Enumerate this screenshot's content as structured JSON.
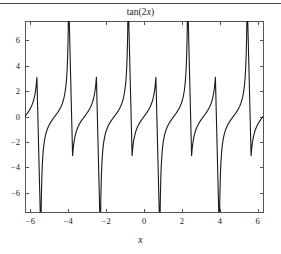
{
  "figure": {
    "title": "tan(2x)",
    "title_prefix": "tan(2",
    "title_var": "x",
    "title_suffix": ")",
    "xlabel": "x",
    "ylabel": "",
    "background_color": "#ffffff",
    "line_color": "#1a1a1a",
    "axis_color": "#555555",
    "has_top_rule": true
  },
  "chart_data": {
    "type": "line",
    "title": "tan(2x)",
    "xlabel": "x",
    "ylabel": "",
    "xlim": [
      -6.2832,
      6.2832
    ],
    "ylim": [
      -7.5,
      7.5
    ],
    "xticks": [
      -6,
      -4,
      -2,
      0,
      2,
      4,
      6
    ],
    "xticklabels": [
      "−6",
      "−4",
      "−2",
      "0",
      "2",
      "4",
      "6"
    ],
    "yticks": [
      -6,
      -4,
      -2,
      0,
      2,
      4,
      6
    ],
    "yticklabels": [
      "−6",
      "−4",
      "−2",
      "0",
      "2",
      "4",
      "6"
    ],
    "grid": false,
    "legend": null,
    "function": "tan(2*x)",
    "sampling": {
      "n_points": 61,
      "x_start": -6.2832,
      "x_end": 6.2832,
      "note": "under-sampled; consecutive samples joined across asymptotes producing steep connecting branches"
    },
    "asymptotes_x": [
      -5.4978,
      -4.7124,
      -3.927,
      -3.1416,
      -2.3562,
      -1.5708,
      -0.7854,
      0.7854,
      1.5708,
      2.3562,
      3.1416,
      3.927,
      4.7124,
      5.4978
    ],
    "zero_crossings_x": [
      -6.2832,
      -4.7124,
      -3.1416,
      -1.5708,
      0,
      1.5708,
      3.1416,
      4.7124,
      6.2832
    ],
    "series": [
      {
        "name": "tan(2x)",
        "color": "#1a1a1a",
        "linewidth": 1.1,
        "x": [
          -6.2832,
          -6.0738,
          -5.8643,
          -5.6549,
          -5.4454,
          -5.236,
          -5.0265,
          -4.8171,
          -4.6077,
          -4.3982,
          -4.1888,
          -3.9794,
          -3.7699,
          -3.5605,
          -3.351,
          -3.1416,
          -2.9322,
          -2.7227,
          -2.5133,
          -2.3038,
          -2.0944,
          -1.885,
          -1.6755,
          -1.4661,
          -1.2566,
          -1.0472,
          -0.8378,
          -0.6283,
          -0.4189,
          -0.2094,
          0,
          0.2094,
          0.4189,
          0.6283,
          0.8378,
          1.0472,
          1.2566,
          1.4661,
          1.6755,
          1.885,
          2.0944,
          2.3038,
          2.5133,
          2.7227,
          2.9322,
          3.1416,
          3.351,
          3.5605,
          3.7699,
          3.9794,
          4.1888,
          4.3982,
          4.6077,
          4.8171,
          5.0265,
          5.236,
          5.4454,
          5.6549,
          5.8643,
          6.0738,
          6.2832
        ],
        "y": [
          0,
          0.4452,
          1.0,
          1.9626,
          5.6713,
          -5.6713,
          -1.9626,
          -1.0,
          -0.4452,
          0,
          0.4452,
          1.0,
          1.9626,
          5.6713,
          -5.6713,
          -1.9626,
          -1.0,
          -0.4452,
          0,
          0.4452,
          1.0,
          1.9626,
          5.6713,
          -5.6713,
          -1.9626,
          -1.0,
          -0.4452,
          0,
          0.4452,
          1.0,
          1.9626,
          5.6713,
          -5.6713,
          -1.9626,
          -1.0,
          -0.4452,
          0,
          0.4452,
          1.0,
          1.9626,
          5.6713,
          -5.6713,
          -1.9626,
          -1.0,
          -0.4452,
          0,
          0.4452,
          1.0,
          1.9626,
          5.6713,
          -5.6713,
          -1.9626,
          -1.0,
          -0.4452,
          0,
          0.4452,
          1.0,
          1.9626,
          5.6713,
          -5.6713,
          0
        ]
      }
    ],
    "axes_box": {
      "left_px": 25,
      "right_px": 263,
      "top_px": 21,
      "bottom_px": 212
    }
  }
}
